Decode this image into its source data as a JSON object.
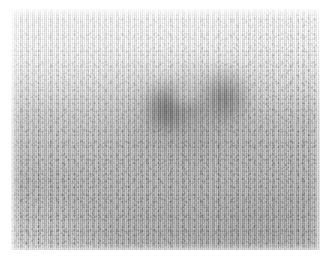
{
  "viewer": {
    "kind": "scintigram-photograph",
    "modality": "Nuclear medicine scintigraphy scan (photographic print)",
    "alt_text": "Grayscale scintigraphy scan showing a mottled dark focus of increased tracer uptake near the centre of a pale grey field, with vertical raster scanlines and photon speckle noise.",
    "caption": "",
    "annotations": [],
    "label_text": ""
  },
  "image": {
    "width_px": 332,
    "height_px": 266,
    "content_left_px": 11,
    "content_top_px": 9,
    "content_width_px": 309,
    "content_height_px": 241,
    "paper_border_color": "#ffffff",
    "colorscale": "grayscale",
    "background_gray": "#bcbcbc",
    "brightest_gray": "#f7f7f7",
    "darkest_gray": "#2a2a2a"
  },
  "features": {
    "background_label": "low-count background field",
    "halo_label": "diffuse uptake halo",
    "lesion_left_label": "left dark uptake lobe",
    "lesion_right_label": "right dark uptake lobe",
    "lesion_bridge_label": "inter-lobe bridge",
    "cold_center_label": "relative photopenic centre",
    "lower_right_label": "grainy lower-right field",
    "speckle_label": "photon speckle noise",
    "scanline_label": "vertical raster scanlines",
    "corner_fade_label": "corner light falloff",
    "edge_bleed_label": "print edge bleed"
  }
}
